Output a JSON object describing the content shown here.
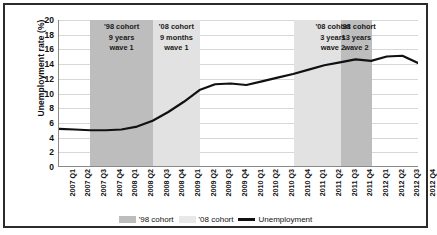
{
  "chart_data": {
    "type": "line",
    "title": "",
    "xlabel": "",
    "ylabel": "Unemployment rate (%)",
    "ylim": [
      0,
      20
    ],
    "ytick_step": 2,
    "yticks": [
      20,
      18,
      16,
      14,
      12,
      10,
      8,
      6,
      4,
      2,
      0
    ],
    "grid": true,
    "legend_position": "bottom",
    "categories": [
      "2007 Q1",
      "2007 Q2",
      "2007 Q3",
      "2007 Q4",
      "2008 Q1",
      "2008 Q2",
      "2008 Q3",
      "2008 Q4",
      "2009 Q1",
      "2009 Q2",
      "2009 Q3",
      "2009 Q4",
      "2010 Q1",
      "2010 Q2",
      "2010 Q3",
      "2010 Q4",
      "2011 Q1",
      "2011 Q2",
      "2011 Q3",
      "2011 Q4",
      "2012 Q1",
      "2012 Q2",
      "2012 Q3",
      "2012 Q4"
    ],
    "series": [
      {
        "name": "Unemployment",
        "color": "#111111",
        "values": [
          5.1,
          5.0,
          4.9,
          4.9,
          5.0,
          5.4,
          6.2,
          7.4,
          8.8,
          10.4,
          11.2,
          11.3,
          11.1,
          11.6,
          12.1,
          12.6,
          13.2,
          13.8,
          14.2,
          14.6,
          14.4,
          15.0,
          15.1,
          14.1
        ]
      }
    ],
    "bands": [
      {
        "id": "band-98-wave1",
        "series": "'98 cohort",
        "label_lines": [
          "'98 cohort",
          "9 years",
          "wave 1"
        ],
        "start": "2007 Q3",
        "end": "2008 Q3",
        "color": "#bdbdbd"
      },
      {
        "id": "band-08-wave1",
        "series": "'08 cohort",
        "label_lines": [
          "'08 cohort",
          "9 months",
          "wave 1"
        ],
        "start": "2008 Q3",
        "end": "2009 Q2",
        "color": "#e2e2e2"
      },
      {
        "id": "band-08-wave2",
        "series": "'08 cohort",
        "label_lines": [
          "'08 cohort",
          "3 years",
          "wave 2"
        ],
        "start": "2010 Q4",
        "end": "2012 Q1",
        "color": "#e2e2e2"
      },
      {
        "id": "band-98-wave2",
        "series": "'98 cohort",
        "label_lines": [
          "'98 cohort",
          "13 years",
          "wave 2"
        ],
        "start": "2011 Q3",
        "end": "2012 Q1",
        "color": "#bdbdbd"
      }
    ],
    "legend": [
      {
        "label": "'98 cohort",
        "type": "swatch",
        "color": "#bdbdbd"
      },
      {
        "label": "'08 cohort",
        "type": "swatch",
        "color": "#e8e8e8"
      },
      {
        "label": "Unemployment",
        "type": "line",
        "color": "#111111"
      }
    ]
  }
}
